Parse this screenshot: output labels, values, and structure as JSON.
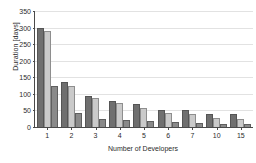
{
  "chart_data": {
    "type": "bar",
    "title": "",
    "subtitle": "",
    "xlabel": "Number of Developers",
    "ylabel": "Duration [days]",
    "categories": [
      "1",
      "2",
      "3",
      "4",
      "5",
      "6",
      "7",
      "10",
      "15"
    ],
    "series": [
      {
        "name": "series-1",
        "color": "#6f6f6f",
        "values": [
          300,
          135,
          95,
          80,
          68,
          52,
          50,
          40,
          38
        ]
      },
      {
        "name": "series-2",
        "color": "#cacaca",
        "values": [
          290,
          125,
          88,
          72,
          58,
          42,
          40,
          28,
          24
        ]
      },
      {
        "name": "series-3",
        "color": "#8a8a8a",
        "values": [
          125,
          42,
          25,
          20,
          17,
          14,
          12,
          10,
          8
        ]
      }
    ],
    "ylim": [
      0,
      350
    ],
    "yticks": [
      0,
      50,
      100,
      150,
      200,
      250,
      300,
      350
    ],
    "ytick_labels": [
      "0",
      "50",
      "100",
      "150",
      "200",
      "250",
      "300",
      "350"
    ],
    "grid": true,
    "grid_axis": "y",
    "legend": "none"
  },
  "axes": {
    "y_title": "Duration [days]",
    "x_title": "Number of Developers"
  }
}
